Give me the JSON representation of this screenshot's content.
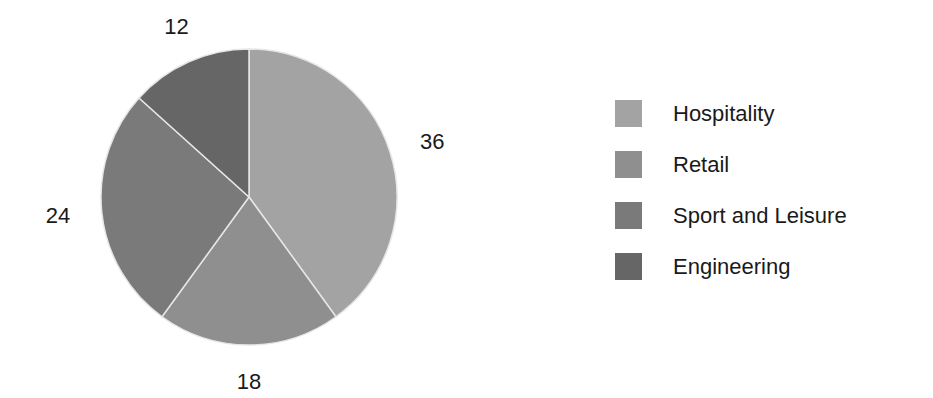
{
  "chart_data": {
    "type": "pie",
    "title": "",
    "categories": [
      "Hospitality",
      "Retail",
      "Sport and Leisure",
      "Engineering"
    ],
    "values": [
      36,
      18,
      24,
      12
    ],
    "colors": [
      "#a3a3a3",
      "#8f8f8f",
      "#7a7a7a",
      "#666666"
    ],
    "data_labels": [
      "36",
      "18",
      "24",
      "12"
    ],
    "start_angle_deg": 0,
    "direction": "clockwise",
    "legend_position": "right"
  },
  "legend": {
    "items": [
      {
        "label": "Hospitality",
        "color": "#a3a3a3"
      },
      {
        "label": "Retail",
        "color": "#8f8f8f"
      },
      {
        "label": "Sport and Leisure",
        "color": "#7a7a7a"
      },
      {
        "label": "Engineering",
        "color": "#666666"
      }
    ]
  }
}
